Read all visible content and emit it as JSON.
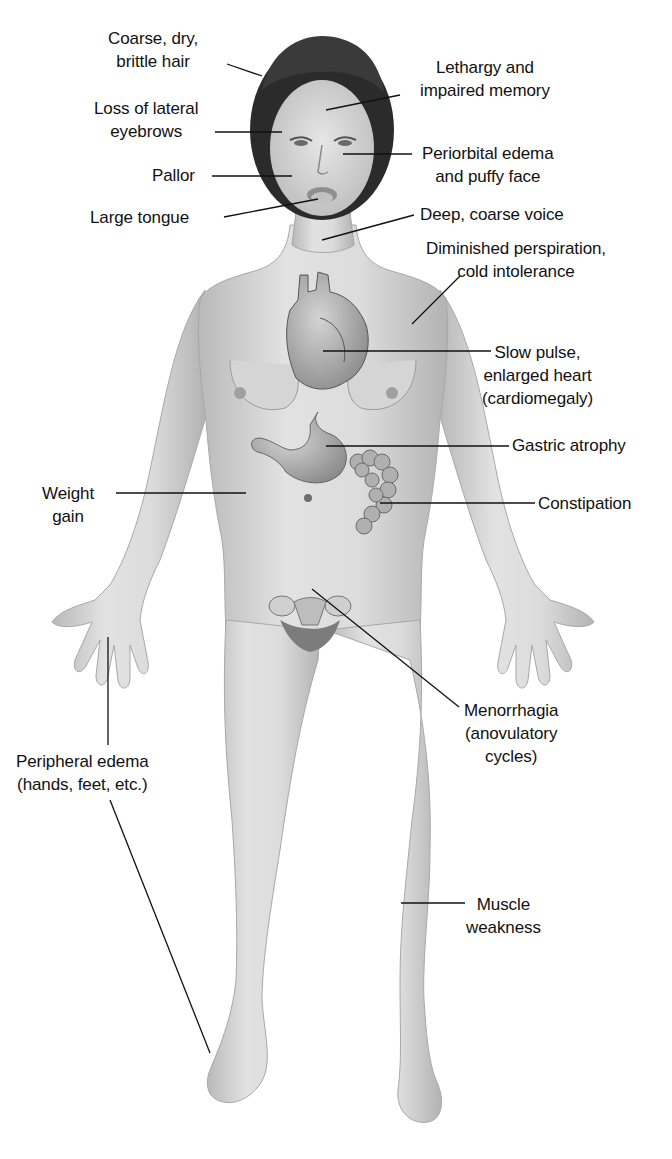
{
  "diagram": {
    "colors": {
      "skin": "#d9d9d9",
      "skin_shadow": "#b5b5b5",
      "hair": "#2b2b2b",
      "line": "#111111",
      "background": "#ffffff"
    },
    "labels": {
      "hair": {
        "line1": "Coarse, dry,",
        "line2": "brittle hair"
      },
      "lethargy": {
        "line1": "Lethargy and",
        "line2": "impaired memory"
      },
      "eyebrows": {
        "line1": "Loss of lateral",
        "line2": "eyebrows"
      },
      "periorbital": {
        "line1": "Periorbital edema",
        "line2": "and puffy face"
      },
      "pallor": {
        "line1": "Pallor"
      },
      "tongue": {
        "line1": "Large tongue"
      },
      "voice": {
        "line1": "Deep, coarse voice"
      },
      "perspiration": {
        "line1": "Diminished perspiration,",
        "line2": "cold intolerance"
      },
      "heart": {
        "line1": "Slow pulse,",
        "line2": "enlarged heart",
        "line3": "(cardiomegaly)"
      },
      "gastric": {
        "line1": "Gastric atrophy"
      },
      "weight": {
        "line1": "Weight",
        "line2": "gain"
      },
      "constipation": {
        "line1": "Constipation"
      },
      "menorrhagia": {
        "line1": "Menorrhagia",
        "line2": "(anovulatory",
        "line3": "cycles)"
      },
      "edema": {
        "line1": "Peripheral edema",
        "line2": "(hands, feet, etc.)"
      },
      "muscle": {
        "line1": "Muscle",
        "line2": "weakness"
      }
    }
  }
}
